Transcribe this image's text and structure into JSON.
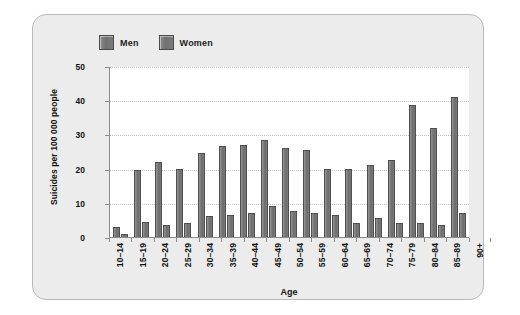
{
  "chart_data": {
    "type": "bar",
    "title": "",
    "xlabel": "Age",
    "ylabel": "Suicides per 100 000 people",
    "ylim": [
      0,
      50
    ],
    "yticks": [
      0,
      10,
      20,
      30,
      40,
      50
    ],
    "grid": true,
    "legend_position": "top-left",
    "categories": [
      "10–14",
      "15–19",
      "20–24",
      "25–29",
      "30–34",
      "35–39",
      "40–44",
      "45–49",
      "50–54",
      "55–59",
      "60–64",
      "65–69",
      "70–74",
      "75–79",
      "80–84",
      "85–89",
      "90+"
    ],
    "series": [
      {
        "name": "Men",
        "color": "#767676",
        "values": [
          3,
          19.5,
          22,
          20,
          24.5,
          26.5,
          27,
          28.5,
          26,
          25.5,
          20,
          20,
          21,
          22.5,
          38.5,
          32,
          41
        ]
      },
      {
        "name": "Women",
        "color": "#767676",
        "values": [
          1,
          4.5,
          3.5,
          4,
          6,
          6.5,
          7,
          9,
          7.5,
          7,
          6.5,
          4,
          5.5,
          4,
          4,
          3.5,
          7
        ]
      }
    ]
  }
}
